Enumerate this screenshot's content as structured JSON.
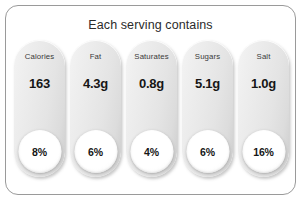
{
  "panel": {
    "title": "Each serving contains",
    "border_color": "#9a9a9a",
    "background_color": "#ffffff"
  },
  "nutrients": [
    {
      "name": "Calories",
      "amount": "163",
      "percent": "8%"
    },
    {
      "name": "Fat",
      "amount": "4.3g",
      "percent": "6%"
    },
    {
      "name": "Saturates",
      "amount": "0.8g",
      "percent": "4%"
    },
    {
      "name": "Sugars",
      "amount": "5.1g",
      "percent": "6%"
    },
    {
      "name": "Salt",
      "amount": "1.0g",
      "percent": "16%"
    }
  ],
  "chart_data": {
    "type": "table",
    "title": "Each serving contains",
    "categories": [
      "Calories",
      "Fat",
      "Saturates",
      "Sugars",
      "Salt"
    ],
    "series": [
      {
        "name": "Amount per serving",
        "values": [
          "163",
          "4.3g",
          "0.8g",
          "5.1g",
          "1.0g"
        ]
      },
      {
        "name": "Reference intake",
        "values": [
          8,
          6,
          4,
          6,
          16
        ],
        "unit": "%"
      }
    ]
  }
}
